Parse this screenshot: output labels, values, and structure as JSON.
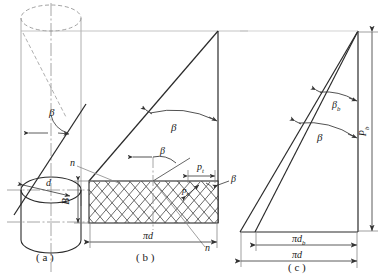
{
  "figure": {
    "line_color": "#222222",
    "thin_color": "#555555",
    "dashdot_color": "#777777",
    "hatch_color": "#333333",
    "background": "#ffffff"
  },
  "panels": [
    {
      "id": "a",
      "caption": "( a )",
      "labels": {
        "helix_angle": "β",
        "diameter": "d"
      }
    },
    {
      "id": "b",
      "caption": "( b )",
      "labels": {
        "helix_angle_upper": "β",
        "helix_angle_mid": "β",
        "helix_angle_right": "β",
        "normal_pitch": "p",
        "normal_pitch_sub": "n",
        "transverse_pitch": "p",
        "transverse_pitch_sub": "t",
        "face_width": "B",
        "normal_direction_top": "n",
        "normal_direction_bottom": "n",
        "base_circumference": "πd"
      }
    },
    {
      "id": "c",
      "caption": "( c )",
      "labels": {
        "base_helix_angle": "β",
        "base_helix_angle_sub": "b",
        "helix_angle": "β",
        "lead": "P",
        "lead_sub": "b",
        "base_circumference": "πd",
        "base_circumference_sub": "b",
        "pitch_circumference": "πd"
      }
    }
  ],
  "symbols": {
    "beta": "β",
    "pi": "π",
    "d": "d",
    "p": "p",
    "P": "P",
    "B": "B",
    "n": "n",
    "b": "b",
    "t": "t"
  }
}
